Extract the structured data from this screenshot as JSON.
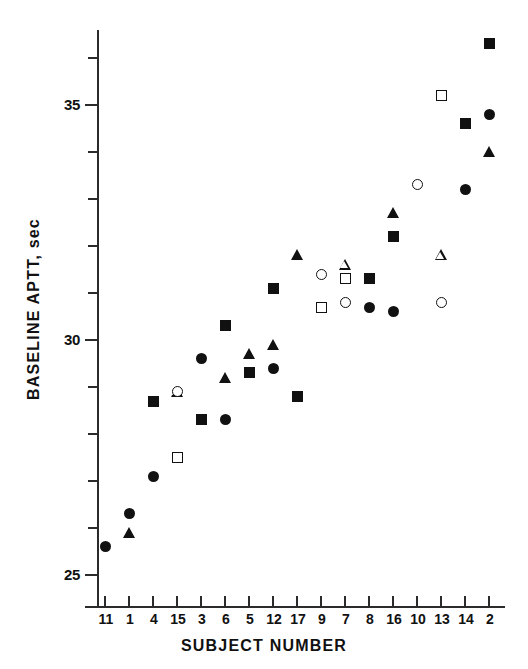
{
  "chart_data": {
    "type": "scatter",
    "title": "",
    "xlabel": "SUBJECT NUMBER",
    "ylabel": "BASELINE APTT, sec",
    "grid": false,
    "legend": "none",
    "ylim": [
      24.5,
      36.8
    ],
    "ytick_labels": [
      "25",
      "30",
      "35"
    ],
    "ytick_values": [
      25,
      30,
      35
    ],
    "yminor_values": [
      26,
      27,
      28,
      29,
      31,
      32,
      33,
      34,
      36
    ],
    "categories": [
      "11",
      "1",
      "4",
      "15",
      "3",
      "6",
      "5",
      "12",
      "17",
      "9",
      "7",
      "8",
      "16",
      "10",
      "13",
      "14",
      "2"
    ],
    "marker_types": [
      "circle-filled",
      "triangle-filled",
      "square-filled",
      "circle-open",
      "triangle-open",
      "square-open"
    ],
    "points": [
      {
        "subject": "11",
        "value": 25.6,
        "marker": "circle-filled"
      },
      {
        "subject": "1",
        "value": 26.3,
        "marker": "circle-filled"
      },
      {
        "subject": "1",
        "value": 25.9,
        "marker": "triangle-filled"
      },
      {
        "subject": "4",
        "value": 28.7,
        "marker": "square-filled"
      },
      {
        "subject": "4",
        "value": 27.1,
        "marker": "circle-filled"
      },
      {
        "subject": "15",
        "value": 28.9,
        "marker": "triangle-open"
      },
      {
        "subject": "15",
        "value": 28.9,
        "marker": "circle-open"
      },
      {
        "subject": "15",
        "value": 27.5,
        "marker": "square-open"
      },
      {
        "subject": "3",
        "value": 29.6,
        "marker": "circle-filled"
      },
      {
        "subject": "3",
        "value": 28.3,
        "marker": "square-filled"
      },
      {
        "subject": "6",
        "value": 30.3,
        "marker": "square-filled"
      },
      {
        "subject": "6",
        "value": 29.2,
        "marker": "triangle-filled"
      },
      {
        "subject": "6",
        "value": 28.3,
        "marker": "circle-filled"
      },
      {
        "subject": "5",
        "value": 29.7,
        "marker": "triangle-filled"
      },
      {
        "subject": "5",
        "value": 29.3,
        "marker": "square-filled"
      },
      {
        "subject": "12",
        "value": 31.1,
        "marker": "square-filled"
      },
      {
        "subject": "12",
        "value": 29.9,
        "marker": "triangle-filled"
      },
      {
        "subject": "12",
        "value": 29.4,
        "marker": "circle-filled"
      },
      {
        "subject": "17",
        "value": 31.8,
        "marker": "triangle-filled"
      },
      {
        "subject": "17",
        "value": 28.8,
        "marker": "square-filled"
      },
      {
        "subject": "9",
        "value": 31.4,
        "marker": "circle-open"
      },
      {
        "subject": "9",
        "value": 30.7,
        "marker": "square-open"
      },
      {
        "subject": "7",
        "value": 31.6,
        "marker": "triangle-open"
      },
      {
        "subject": "7",
        "value": 31.3,
        "marker": "square-open"
      },
      {
        "subject": "7",
        "value": 30.8,
        "marker": "circle-open"
      },
      {
        "subject": "8",
        "value": 31.3,
        "marker": "square-filled"
      },
      {
        "subject": "8",
        "value": 30.7,
        "marker": "circle-filled"
      },
      {
        "subject": "16",
        "value": 32.7,
        "marker": "triangle-filled"
      },
      {
        "subject": "16",
        "value": 32.2,
        "marker": "square-filled"
      },
      {
        "subject": "16",
        "value": 30.6,
        "marker": "circle-filled"
      },
      {
        "subject": "10",
        "value": 33.3,
        "marker": "circle-open"
      },
      {
        "subject": "13",
        "value": 35.2,
        "marker": "square-open"
      },
      {
        "subject": "13",
        "value": 31.8,
        "marker": "triangle-open"
      },
      {
        "subject": "13",
        "value": 30.8,
        "marker": "circle-open"
      },
      {
        "subject": "14",
        "value": 34.6,
        "marker": "square-filled"
      },
      {
        "subject": "14",
        "value": 33.2,
        "marker": "circle-filled"
      },
      {
        "subject": "2",
        "value": 36.3,
        "marker": "square-filled"
      },
      {
        "subject": "2",
        "value": 34.8,
        "marker": "circle-filled"
      },
      {
        "subject": "2",
        "value": 34.0,
        "marker": "triangle-filled"
      }
    ]
  }
}
